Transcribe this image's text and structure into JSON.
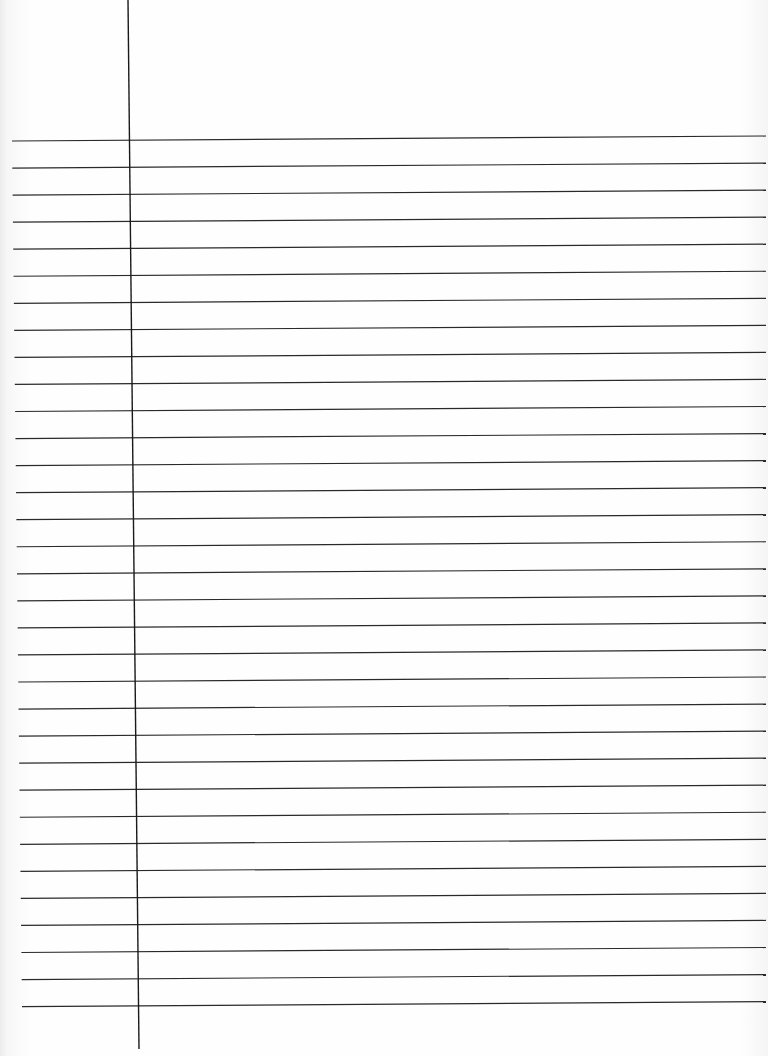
{
  "page": {
    "type": "lined-paper",
    "width": 768,
    "height": 1056,
    "line_color": "#2a2a2a",
    "margin_line_color": "#1a1a1a",
    "rule": {
      "count": 33,
      "first_y_left": 141,
      "spacing": 27.05,
      "left_x_start": 12,
      "left_x_end": 22,
      "right_x": 766,
      "slope_px": -5
    },
    "margin_line": {
      "x_top": 128,
      "x_bottom": 139,
      "y_top": 0,
      "y_bottom": 1049
    }
  }
}
